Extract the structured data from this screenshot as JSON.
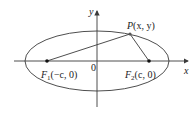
{
  "diagram": {
    "type": "ellipse-with-foci",
    "colors": {
      "stroke": "#3a3a3a",
      "text": "#222222",
      "background": "#ffffff"
    },
    "axes": {
      "x_label": "x",
      "y_label": "y",
      "origin_label": "0"
    },
    "ellipse": {
      "cx": 97,
      "cy": 61,
      "rx": 72,
      "ry": 30
    },
    "foci": [
      {
        "name": "F1",
        "label_main": "F",
        "label_sub": "1",
        "label_coords": "(−c, 0)",
        "x": 47,
        "y": 61
      },
      {
        "name": "F2",
        "label_main": "F",
        "label_sub": "2",
        "label_coords": "(c, 0)",
        "x": 149,
        "y": 61
      }
    ],
    "point": {
      "label_main": "P",
      "label_coords": "(x, y)",
      "x": 130,
      "y": 34
    }
  }
}
